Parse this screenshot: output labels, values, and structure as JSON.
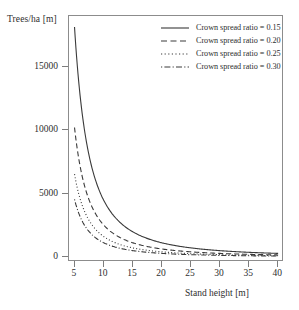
{
  "chart_data": {
    "type": "line",
    "title": "",
    "xlabel": "Stand height [m]",
    "ylabel": "Trees/ha [m]",
    "xlim": [
      4,
      41
    ],
    "ylim": [
      -400,
      19000
    ],
    "xticks": [
      5,
      10,
      15,
      20,
      25,
      30,
      35,
      40
    ],
    "xticklabels": [
      "5",
      "10",
      "15",
      "20",
      "25",
      "30",
      "35",
      "40"
    ],
    "yticks": [
      0,
      5000,
      10000,
      15000
    ],
    "yticklabels": [
      "0",
      "5000",
      "10000",
      "15000"
    ],
    "grid": false,
    "legend_position": "upper right",
    "x": [
      5,
      6,
      7,
      8,
      9,
      10,
      11,
      12,
      13,
      14,
      15,
      16,
      17,
      18,
      19,
      20,
      22,
      24,
      26,
      28,
      30,
      32,
      34,
      36,
      38,
      40
    ],
    "series": [
      {
        "name": "Crown spread ratio = 0.15",
        "linestyle": "solid",
        "color": "#3a3a3a",
        "values": [
          17778,
          12346,
          9070,
          6944,
          5487,
          4444,
          3673,
          3086,
          2630,
          2268,
          1975,
          1736,
          1537,
          1372,
          1231,
          1111,
          918,
          772,
          657,
          567,
          494,
          434,
          384,
          343,
          308,
          278
        ]
      },
      {
        "name": "Crown spread ratio = 0.20",
        "linestyle": "dashed",
        "color": "#3a3a3a",
        "values": [
          10000,
          6944,
          5102,
          3906,
          3086,
          2500,
          2066,
          1736,
          1479,
          1276,
          1111,
          977,
          865,
          772,
          693,
          625,
          517,
          434,
          370,
          319,
          278,
          244,
          216,
          193,
          173,
          156
        ]
      },
      {
        "name": "Crown spread ratio = 0.25",
        "linestyle": "dotted",
        "color": "#3a3a3a",
        "values": [
          6400,
          4444,
          3265,
          2500,
          1975,
          1600,
          1322,
          1111,
          947,
          816,
          711,
          625,
          554,
          494,
          443,
          400,
          331,
          278,
          237,
          204,
          178,
          156,
          138,
          123,
          111,
          100
        ]
      },
      {
        "name": "Crown spread ratio = 0.30",
        "linestyle": "dashdot",
        "color": "#3a3a3a",
        "values": [
          4444,
          3086,
          2268,
          1736,
          1372,
          1111,
          918,
          772,
          657,
          567,
          494,
          434,
          384,
          343,
          308,
          278,
          230,
          193,
          164,
          142,
          123,
          109,
          96,
          86,
          77,
          69
        ]
      }
    ],
    "legend_entries": [
      {
        "label": "Crown spread ratio = 0.15",
        "style": "solid"
      },
      {
        "label": "Crown spread ratio = 0.20",
        "style": "dashed"
      },
      {
        "label": "Crown spread ratio = 0.25",
        "style": "dotted"
      },
      {
        "label": "Crown spread ratio = 0.30",
        "style": "dashdot"
      }
    ],
    "frame_color": "#8c8c8c",
    "background": "#ffffff"
  }
}
